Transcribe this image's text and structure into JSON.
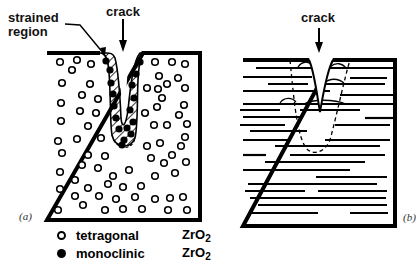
{
  "figure": {
    "panel_a": {
      "label": "(a)",
      "crack_label": "crack",
      "strained_label_line1": "strained",
      "strained_label_line2": "region"
    },
    "panel_b": {
      "label": "(b)",
      "crack_label": "crack"
    },
    "legend": [
      {
        "symbol": "open-circle",
        "name": "tetragonal",
        "formula": "ZrO",
        "subscript": "2"
      },
      {
        "symbol": "filled-circle",
        "name": "monoclinic",
        "formula": "ZrO",
        "subscript": "2"
      }
    ]
  },
  "colors": {
    "ink": "#000000",
    "background": "#ffffff"
  }
}
